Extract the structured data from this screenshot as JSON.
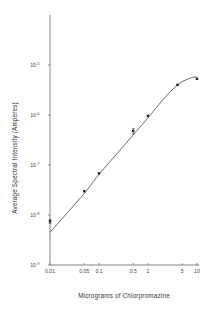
{
  "chart_data": {
    "type": "line",
    "title": "",
    "xlabel": "Micrograms of Chlorpromazine",
    "ylabel": "Average Spectral Intensity (Amperes)",
    "xscale": "log",
    "yscale": "log",
    "xlim": [
      0.01,
      10
    ],
    "ylim": [
      1e-09,
      0.0001
    ],
    "grid": false,
    "x_ticks": [
      {
        "value": 0.01,
        "label": "0.01"
      },
      {
        "value": 0.05,
        "label": "0.05"
      },
      {
        "value": 0.1,
        "label": "0.1"
      },
      {
        "value": 0.5,
        "label": "0.5"
      },
      {
        "value": 1,
        "label": "1"
      },
      {
        "value": 5,
        "label": "5"
      },
      {
        "value": 10,
        "label": "10"
      }
    ],
    "y_ticks": [
      {
        "value": 1e-09,
        "base": "10",
        "exp": "-9"
      },
      {
        "value": 1e-08,
        "base": "10",
        "exp": "-8"
      },
      {
        "value": 1e-07,
        "base": "10",
        "exp": "-7"
      },
      {
        "value": 1e-06,
        "base": "10",
        "exp": "-6"
      },
      {
        "value": 1e-05,
        "base": "10",
        "exp": "-5"
      }
    ],
    "series": [
      {
        "name": "measured",
        "points": [
          {
            "x": 0.01,
            "y": 7.5e-09,
            "err_low": 6.8e-09,
            "err_high": 8.2e-09
          },
          {
            "x": 0.05,
            "y": 3e-08
          },
          {
            "x": 0.1,
            "y": 6.8e-08
          },
          {
            "x": 0.5,
            "y": 4.8e-07,
            "err_low": 4.2e-07,
            "err_high": 5.4e-07
          },
          {
            "x": 1,
            "y": 9.6e-07
          },
          {
            "x": 4,
            "y": 4e-06
          },
          {
            "x": 10,
            "y": 5.3e-06
          }
        ]
      },
      {
        "name": "fitted-curve",
        "points": [
          {
            "x": 0.01,
            "y": 4.5e-09
          },
          {
            "x": 0.05,
            "y": 2.7e-08
          },
          {
            "x": 0.1,
            "y": 6.5e-08
          },
          {
            "x": 0.5,
            "y": 4e-07
          },
          {
            "x": 1,
            "y": 8.8e-07
          },
          {
            "x": 2,
            "y": 2e-06
          },
          {
            "x": 4,
            "y": 4e-06
          },
          {
            "x": 7,
            "y": 5.4e-06
          },
          {
            "x": 10,
            "y": 5.8e-06
          }
        ]
      }
    ]
  }
}
